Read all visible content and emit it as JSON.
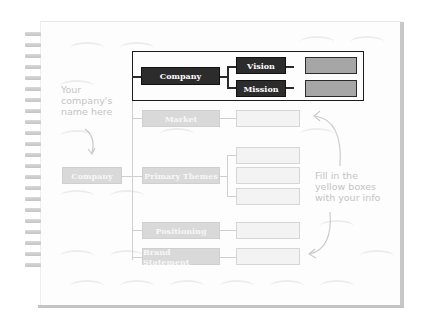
{
  "diagram": {
    "root": {
      "label": "Company"
    },
    "highlighted_group": {
      "company": "Company",
      "vision": "Vision",
      "mission": "Mission"
    },
    "branches": [
      {
        "label": "Market",
        "fields": 1
      },
      {
        "label": "Primary Themes",
        "fields": 3
      },
      {
        "label": "Positioning",
        "fields": 1
      },
      {
        "label": "Brand Statement",
        "fields": 1
      }
    ],
    "annotations": {
      "left_note": [
        "Your",
        "company's",
        "name here"
      ],
      "right_note": [
        "Fill in the",
        "yellow boxes",
        "with your info"
      ]
    }
  },
  "colors": {
    "highlight_box": "#2c2c2c",
    "faded_box": "#d9d9d9",
    "input_gray": "#a6a6a6",
    "empty_field": "#f3f3f3"
  }
}
